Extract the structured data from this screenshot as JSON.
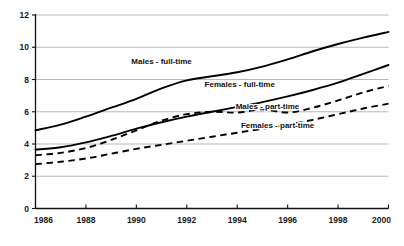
{
  "chart_data": {
    "type": "line",
    "title": "",
    "subtitle": "",
    "xlabel": "",
    "ylabel": "",
    "xlim": [
      1986,
      2000
    ],
    "ylim": [
      0,
      12
    ],
    "grid": true,
    "legend_position": "inline-annotations",
    "x_ticks": [
      "1986",
      "1988",
      "1990",
      "1992",
      "1994",
      "1996",
      "1998",
      "2000"
    ],
    "x_tick_values": [
      1986,
      1988,
      1990,
      1992,
      1994,
      1996,
      1998,
      2000
    ],
    "y_ticks": [
      "0",
      "2",
      "4",
      "6",
      "8",
      "10",
      "12"
    ],
    "y_tick_values": [
      0,
      2,
      4,
      6,
      8,
      10,
      12
    ],
    "x": [
      1986,
      1987,
      1988,
      1989,
      1990,
      1991,
      1992,
      1993,
      1994,
      1995,
      1996,
      1997,
      1998,
      1999,
      2000
    ],
    "series": [
      {
        "name": "Males - full-time",
        "style": "solid",
        "color": "#000000",
        "label_x": 1991.0,
        "label_y": 8.95,
        "values": [
          4.85,
          5.2,
          5.7,
          6.25,
          6.8,
          7.45,
          7.95,
          8.2,
          8.45,
          8.8,
          9.25,
          9.75,
          10.2,
          10.6,
          10.95
        ]
      },
      {
        "name": "Females - full-time",
        "style": "solid",
        "color": "#000000",
        "label_x": 1994.1,
        "label_y": 7.55,
        "values": [
          3.65,
          3.8,
          4.1,
          4.5,
          4.95,
          5.35,
          5.7,
          6.0,
          6.3,
          6.6,
          6.95,
          7.35,
          7.8,
          8.35,
          8.9
        ]
      },
      {
        "name": "Males - part-time",
        "style": "dashed",
        "color": "#000000",
        "label_x": 1995.2,
        "label_y": 6.15,
        "values": [
          3.3,
          3.45,
          3.75,
          4.25,
          4.85,
          5.45,
          5.85,
          6.0,
          5.95,
          6.15,
          5.95,
          6.25,
          6.7,
          7.2,
          7.6
        ]
      },
      {
        "name": "Females - part-time",
        "style": "dashed",
        "color": "#000000",
        "label_x": 1995.6,
        "label_y": 5.0,
        "values": [
          2.75,
          2.9,
          3.1,
          3.4,
          3.7,
          3.95,
          4.2,
          4.45,
          4.7,
          4.95,
          5.2,
          5.5,
          5.85,
          6.2,
          6.5
        ]
      }
    ],
    "annotations": [
      {
        "text": "Males - full-time"
      },
      {
        "text": "Females - full-time"
      },
      {
        "text": "Males - part-time"
      },
      {
        "text": "Females - part-time"
      }
    ]
  }
}
